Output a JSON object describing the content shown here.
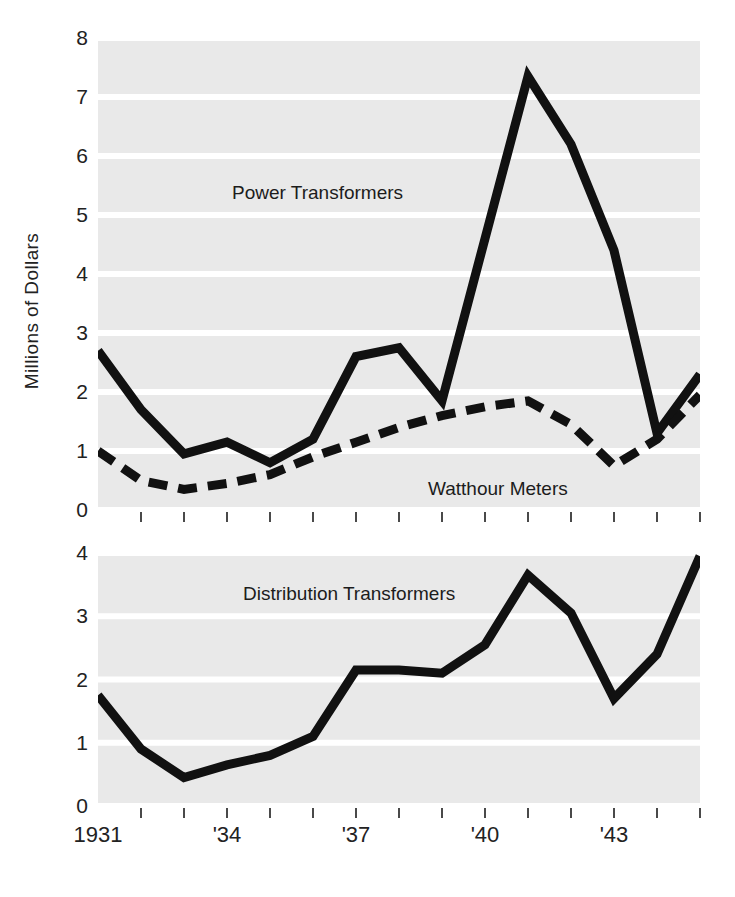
{
  "figure": {
    "ylabel": "Millions of Dollars",
    "background_color": "#ffffff",
    "band_color": "#e9e9e9",
    "line_color": "#111111"
  },
  "chart_data": [
    {
      "type": "line",
      "panel": "top",
      "title": "",
      "xlabel": "",
      "ylabel": "Millions of Dollars",
      "xlim": [
        1931,
        1945
      ],
      "ylim": [
        0,
        8
      ],
      "yticks": [
        0,
        1,
        2,
        3,
        4,
        5,
        6,
        7,
        8
      ],
      "grid": true,
      "legend": "inline-annotations",
      "x": [
        1931,
        1932,
        1933,
        1934,
        1935,
        1936,
        1937,
        1938,
        1939,
        1940,
        1941,
        1942,
        1943,
        1944,
        1945
      ],
      "series": [
        {
          "name": "Power Transformers",
          "style": "solid",
          "values": [
            2.7,
            1.7,
            0.95,
            1.15,
            0.8,
            1.2,
            2.6,
            2.75,
            1.85,
            4.6,
            7.35,
            6.2,
            4.4,
            1.3,
            2.3
          ]
        },
        {
          "name": "Watthour Meters",
          "style": "dashed",
          "values": [
            1.0,
            0.5,
            0.35,
            0.45,
            0.6,
            0.9,
            1.15,
            1.4,
            1.6,
            1.75,
            1.85,
            1.45,
            0.75,
            1.2,
            1.95
          ]
        }
      ]
    },
    {
      "type": "line",
      "panel": "bottom",
      "title": "",
      "xlabel": "",
      "ylabel": "",
      "xlim": [
        1931,
        1945
      ],
      "ylim": [
        0,
        4
      ],
      "yticks": [
        0,
        1,
        2,
        3,
        4
      ],
      "grid": true,
      "legend": "inline-annotations",
      "x": [
        1931,
        1932,
        1933,
        1934,
        1935,
        1936,
        1937,
        1938,
        1939,
        1940,
        1941,
        1942,
        1943,
        1944,
        1945
      ],
      "series": [
        {
          "name": "Distribution Transformers",
          "style": "solid",
          "values": [
            1.75,
            0.9,
            0.45,
            0.65,
            0.8,
            1.1,
            2.15,
            2.15,
            2.1,
            2.55,
            3.65,
            3.05,
            1.7,
            2.4,
            3.95
          ]
        }
      ]
    }
  ],
  "axes": {
    "top": {
      "ytick_labels": [
        "0",
        "1",
        "2",
        "3",
        "4",
        "5",
        "6",
        "7",
        "8"
      ]
    },
    "bottom": {
      "ytick_labels": [
        "0",
        "1",
        "2",
        "3",
        "4"
      ]
    },
    "xtick_labels": [
      {
        "text": "1931",
        "year": 1931
      },
      {
        "text": "'34",
        "year": 1934
      },
      {
        "text": "'37",
        "year": 1937
      },
      {
        "text": "'40",
        "year": 1940
      },
      {
        "text": "'43",
        "year": 1943
      }
    ],
    "xtick_years": [
      1932,
      1933,
      1934,
      1935,
      1936,
      1937,
      1938,
      1939,
      1940,
      1941,
      1942,
      1943,
      1944,
      1945
    ]
  },
  "annotations": {
    "power": "Power Transformers",
    "watthour": "Watthour Meters",
    "distribution": "Distribution Transformers"
  }
}
